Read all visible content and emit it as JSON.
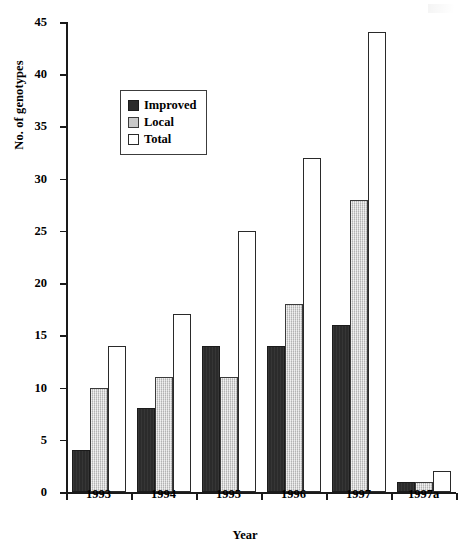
{
  "chart_data": {
    "type": "bar",
    "title": "",
    "xlabel": "Year",
    "ylabel": "No. of genotypes",
    "categories": [
      "1993",
      "1994",
      "1995",
      "1996",
      "1997",
      "1997a"
    ],
    "series": [
      {
        "name": "Improved",
        "color": "#2b2b2b",
        "values": [
          4,
          8,
          14,
          14,
          16,
          1
        ]
      },
      {
        "name": "Local",
        "color": "#c9c9c9",
        "values": [
          10,
          11,
          11,
          18,
          28,
          1
        ]
      },
      {
        "name": "Total",
        "color": "#ffffff",
        "values": [
          14,
          17,
          25,
          32,
          44,
          2
        ]
      }
    ],
    "ylim": [
      0,
      45
    ],
    "ytick_step": 5,
    "yticks": [
      "0",
      "5",
      "10",
      "15",
      "20",
      "25",
      "30",
      "35",
      "40",
      "45"
    ],
    "grid": false,
    "legend_position": "upper-left-inside",
    "legend_entries": [
      "Improved",
      "Local",
      "Total"
    ]
  }
}
